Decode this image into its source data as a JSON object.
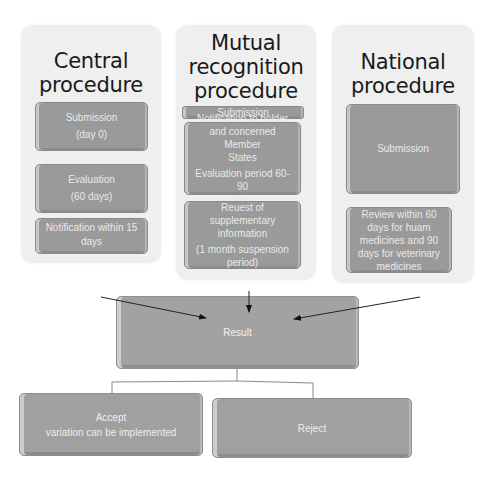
{
  "columns": [
    {
      "title_line1": "Central",
      "title_line2": "procedure",
      "steps": [
        {
          "line1": "Submission",
          "line2": "(day 0)"
        },
        {
          "line1": "Evaluation",
          "line2": "(60 days)"
        },
        {
          "line1": "Notification within 15",
          "line2": "days"
        }
      ]
    },
    {
      "title_line1": "Mutual",
      "title_line2": "recognition",
      "title_line3": "procedure",
      "steps": [
        {
          "line1": "Submission"
        },
        {
          "line1": "Notification to holder",
          "line2": "and concerned Member",
          "line3": "States",
          "line4": "Evaluation period 60-90",
          "line5": "days"
        },
        {
          "line1": "Reuest of",
          "line2": "supplementary",
          "line3": "information",
          "line4": "(1 month suspension",
          "line5": "period)"
        }
      ]
    },
    {
      "title_line1": "National",
      "title_line2": "procedure",
      "steps": [
        {
          "line1": "Submission"
        },
        {
          "line1": "Review within 60",
          "line2": "days for huam",
          "line3": "medicines and 90",
          "line4": "days for veterinary",
          "line5": "medicines"
        }
      ]
    }
  ],
  "result": {
    "label": "Result"
  },
  "outcomes": [
    {
      "line1": "Accept",
      "line2": "variation can be implemented"
    },
    {
      "line1": "Reject"
    }
  ]
}
